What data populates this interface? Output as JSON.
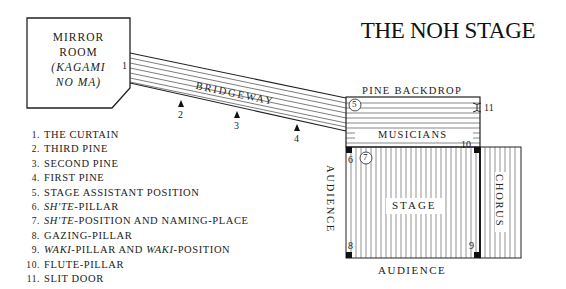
{
  "title": "THE NOH STAGE",
  "mirror_room": {
    "line1": "MIRROR",
    "line2": "ROOM",
    "line3": "(KAGAMI",
    "line4": "NO MA)"
  },
  "areas": {
    "bridgeway": "BRIDGEWAY",
    "pine_backdrop": "PINE BACKDROP",
    "musicians": "MUSICIANS",
    "stage": "STAGE",
    "chorus": "CHORUS",
    "audience_left": "AUDIENCE",
    "audience_bottom": "AUDIENCE"
  },
  "markers": {
    "m1": "1",
    "m2": "2",
    "m3": "3",
    "m4": "4",
    "m5": "5",
    "m6": "6",
    "m7": "7",
    "m8": "8",
    "m9": "9",
    "m10": "10",
    "m11": "11"
  },
  "legend": [
    {
      "num": "1.",
      "text": "THE CURTAIN"
    },
    {
      "num": "2.",
      "text": "THIRD PINE"
    },
    {
      "num": "3.",
      "text": "SECOND PINE"
    },
    {
      "num": "4.",
      "text": "FIRST PINE"
    },
    {
      "num": "5.",
      "text": "STAGE ASSISTANT POSITION"
    },
    {
      "num": "6.",
      "italic": "SH'TE",
      "text": "-PILLAR"
    },
    {
      "num": "7.",
      "italic": "SH'TE",
      "text": "-POSITION AND NAMING-PLACE"
    },
    {
      "num": "8.",
      "text": "GAZING-PILLAR"
    },
    {
      "num": "9.",
      "italic": "WAKI",
      "text": "-PILLAR AND ",
      "italic2": "WAKI",
      "text2": "-POSITION"
    },
    {
      "num": "10.",
      "text": "FLUTE-PILLAR"
    },
    {
      "num": "11.",
      "text": "SLIT DOOR"
    }
  ]
}
